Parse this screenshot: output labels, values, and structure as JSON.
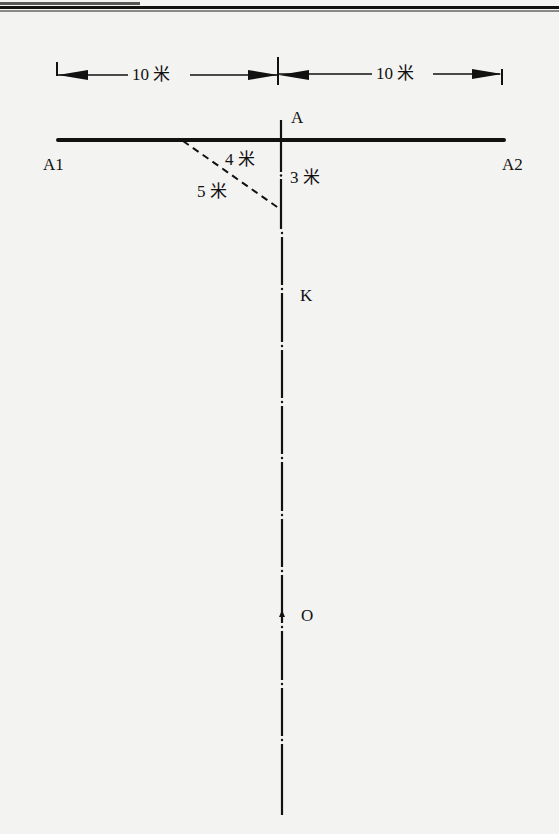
{
  "diagram": {
    "dimensions": {
      "left_span": "10 米",
      "right_span": "10 米"
    },
    "points": {
      "A": "A",
      "A1": "A1",
      "A2": "A2",
      "K": "K",
      "O": "O"
    },
    "triangle": {
      "leg_horizontal": "4 米",
      "leg_vertical": "3 米",
      "hypotenuse": "5 米"
    },
    "colors": {
      "line": "#111111",
      "background": "#f3f3f2"
    }
  }
}
